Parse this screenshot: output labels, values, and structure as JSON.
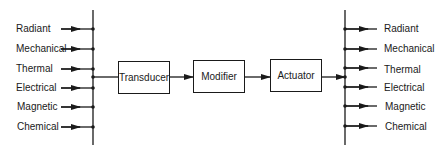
{
  "diagram": {
    "type": "block-diagram",
    "inputs": [
      "Radiant",
      "Mechanical",
      "Thermal",
      "Electrical",
      "Magnetic",
      "Chemical"
    ],
    "blocks": [
      "Transducer",
      "Modifier",
      "Actuator"
    ],
    "outputs": [
      "Radiant",
      "Mechanical",
      "Thermal",
      "Electrical",
      "Magnetic",
      "Chemical"
    ],
    "line_color": "#1a1a1a"
  }
}
